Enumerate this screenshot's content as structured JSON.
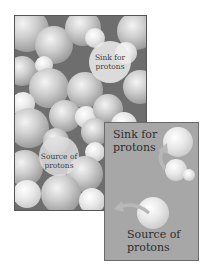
{
  "figure": {
    "main_panel": {
      "description": "Space-filling model of water molecules",
      "labels": {
        "sink": "Sink for protons",
        "source": "Source of protons"
      }
    },
    "inset_panel": {
      "labels": {
        "sink_line1": "Sink for",
        "sink_line2": "protons",
        "source_line1": "Source of",
        "source_line2": "protons"
      }
    },
    "colors": {
      "main_background": "#6e6e6e",
      "inset_background": "#a7a7a7",
      "arrow": "#b5b5b5"
    }
  },
  "main_labels": {
    "sink_line1": "Sink for",
    "sink_line2": "protons",
    "source_line1": "Source of",
    "source_line2": "protons"
  }
}
